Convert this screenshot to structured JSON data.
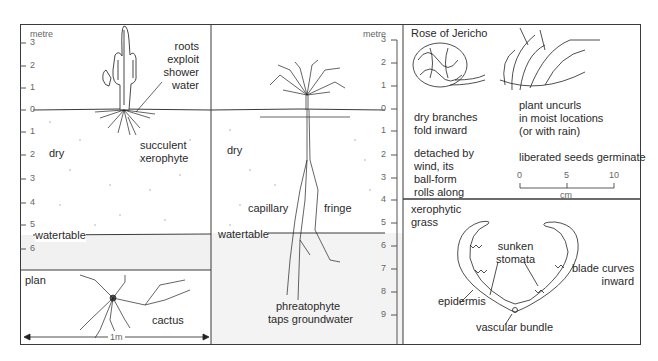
{
  "figure": {
    "panels": {
      "cactus": {
        "scale_unit": "metre",
        "scale_ticks": [
          "3",
          "2",
          "1",
          "0",
          "1",
          "2",
          "3",
          "4",
          "5",
          "6"
        ],
        "annotation_roots": [
          "roots",
          "exploit",
          "shower",
          "water"
        ],
        "label_plant": [
          "succulent",
          "xerophyte"
        ],
        "soil_label": "dry",
        "watertable_label": "watertable"
      },
      "plan": {
        "title": "plan",
        "plant_label": "cactus",
        "scale_label": "1m"
      },
      "phreatophyte": {
        "scale_unit": "metre",
        "scale_ticks": [
          "3",
          "2",
          "1",
          "0",
          "1",
          "2",
          "3",
          "4",
          "5",
          "6",
          "7",
          "8",
          "9"
        ],
        "soil_label": "dry",
        "capillary_label": "capillary",
        "fringe_label": "fringe",
        "watertable_label": "watertable",
        "plant_label": [
          "phreatophyte",
          "taps groundwater"
        ]
      },
      "rose_of_jericho": {
        "title": "Rose of Jericho",
        "dry_caption": [
          "dry branches",
          "fold inward"
        ],
        "detached_caption": [
          "detached by",
          "wind, its",
          "ball-form",
          "rolls along"
        ],
        "moist_caption": [
          "plant uncurls",
          "in moist locations",
          "(or with rain)"
        ],
        "seeds_caption": "liberated seeds germinate",
        "scale_ticks": [
          "0",
          "5",
          "10"
        ],
        "scale_unit": "cm"
      },
      "xerophytic_grass": {
        "title": [
          "xerophytic",
          "grass"
        ],
        "stomata_label": [
          "sunken",
          "stomata"
        ],
        "blade_label": [
          "blade curves",
          "inward"
        ],
        "epidermis_label": "epidermis",
        "vascular_label": "vascular bundle"
      }
    },
    "colors": {
      "line": "#3a3a3a",
      "groundwater_fill": "#f1f1f1",
      "tick_text": "#666666"
    }
  }
}
